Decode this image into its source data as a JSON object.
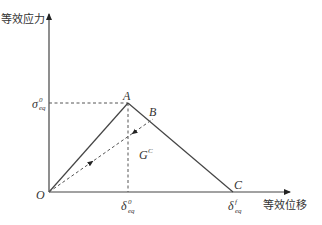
{
  "diagram": {
    "axes": {
      "y_label": "等效应力",
      "x_label": "等效位移",
      "origin_label": "O"
    },
    "points": {
      "A": {
        "label": "A",
        "desc": "peak: (δ⁰_eq, σ⁰_eq)"
      },
      "B": {
        "label": "B",
        "desc": "point on softening branch (unloading start)"
      },
      "C": {
        "label": "C",
        "desc": "complete failure: (δᶠ_eq, 0)"
      }
    },
    "tick_labels": {
      "sigma0": {
        "main": "σ",
        "sup": "0",
        "sub": "eq"
      },
      "delta0": {
        "main": "δ",
        "sup": "0",
        "sub": "eq"
      },
      "deltaf": {
        "main": "δ",
        "sup": "f",
        "sub": "eq"
      }
    },
    "area_label": {
      "main": "G",
      "sup": "C"
    },
    "colors": {
      "axis": "#333333",
      "curve": "#444444",
      "dashed": "#555555",
      "text": "#333333"
    }
  }
}
